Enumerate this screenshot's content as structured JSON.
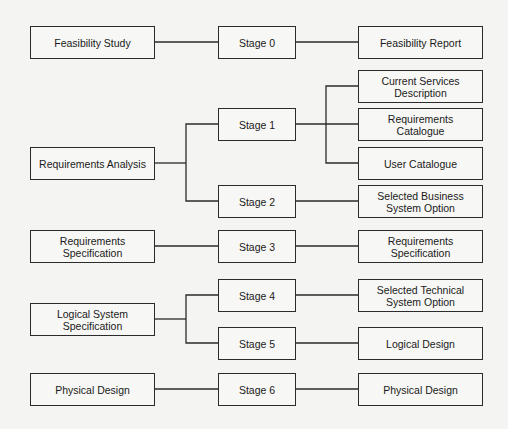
{
  "diagram": {
    "inputs": [
      {
        "id": "feasibility-study",
        "label": "Feasibility Study"
      },
      {
        "id": "requirements-analysis",
        "label": "Requirements Analysis"
      },
      {
        "id": "requirements-specification",
        "label": "Requirements\nSpecification"
      },
      {
        "id": "logical-system-specification",
        "label": "Logical System\nSpecification"
      },
      {
        "id": "physical-design",
        "label": "Physical Design"
      }
    ],
    "stages": [
      {
        "id": "stage-0",
        "label": "Stage 0"
      },
      {
        "id": "stage-1",
        "label": "Stage 1"
      },
      {
        "id": "stage-2",
        "label": "Stage 2"
      },
      {
        "id": "stage-3",
        "label": "Stage 3"
      },
      {
        "id": "stage-4",
        "label": "Stage 4"
      },
      {
        "id": "stage-5",
        "label": "Stage 5"
      },
      {
        "id": "stage-6",
        "label": "Stage 6"
      }
    ],
    "outputs": [
      {
        "id": "feasibility-report",
        "label": "Feasibility Report"
      },
      {
        "id": "current-services-description",
        "label": "Current Services\nDescription"
      },
      {
        "id": "requirements-catalogue",
        "label": "Requirements Catalogue"
      },
      {
        "id": "user-catalogue",
        "label": "User Catalogue"
      },
      {
        "id": "selected-business-system-option",
        "label": "Selected Business\nSystem Option"
      },
      {
        "id": "requirements-specification-out",
        "label": "Requirements\nSpecification"
      },
      {
        "id": "selected-technical-system-option",
        "label": "Selected Technical\nSystem Option"
      },
      {
        "id": "logical-design",
        "label": "Logical Design"
      },
      {
        "id": "physical-design-out",
        "label": "Physical Design"
      }
    ],
    "connections": [
      [
        "Feasibility Study",
        "Stage 0"
      ],
      [
        "Stage 0",
        "Feasibility Report"
      ],
      [
        "Requirements Analysis",
        "Stage 1"
      ],
      [
        "Requirements Analysis",
        "Stage 2"
      ],
      [
        "Stage 1",
        "Current Services Description"
      ],
      [
        "Stage 1",
        "Requirements Catalogue"
      ],
      [
        "Stage 1",
        "User Catalogue"
      ],
      [
        "Stage 2",
        "Selected Business System Option"
      ],
      [
        "Requirements Specification",
        "Stage 3"
      ],
      [
        "Stage 3",
        "Requirements Specification"
      ],
      [
        "Logical System Specification",
        "Stage 4"
      ],
      [
        "Logical System Specification",
        "Stage 5"
      ],
      [
        "Stage 4",
        "Selected Technical System Option"
      ],
      [
        "Stage 5",
        "Logical Design"
      ],
      [
        "Physical Design",
        "Stage 6"
      ],
      [
        "Stage 6",
        "Physical Design"
      ]
    ]
  }
}
